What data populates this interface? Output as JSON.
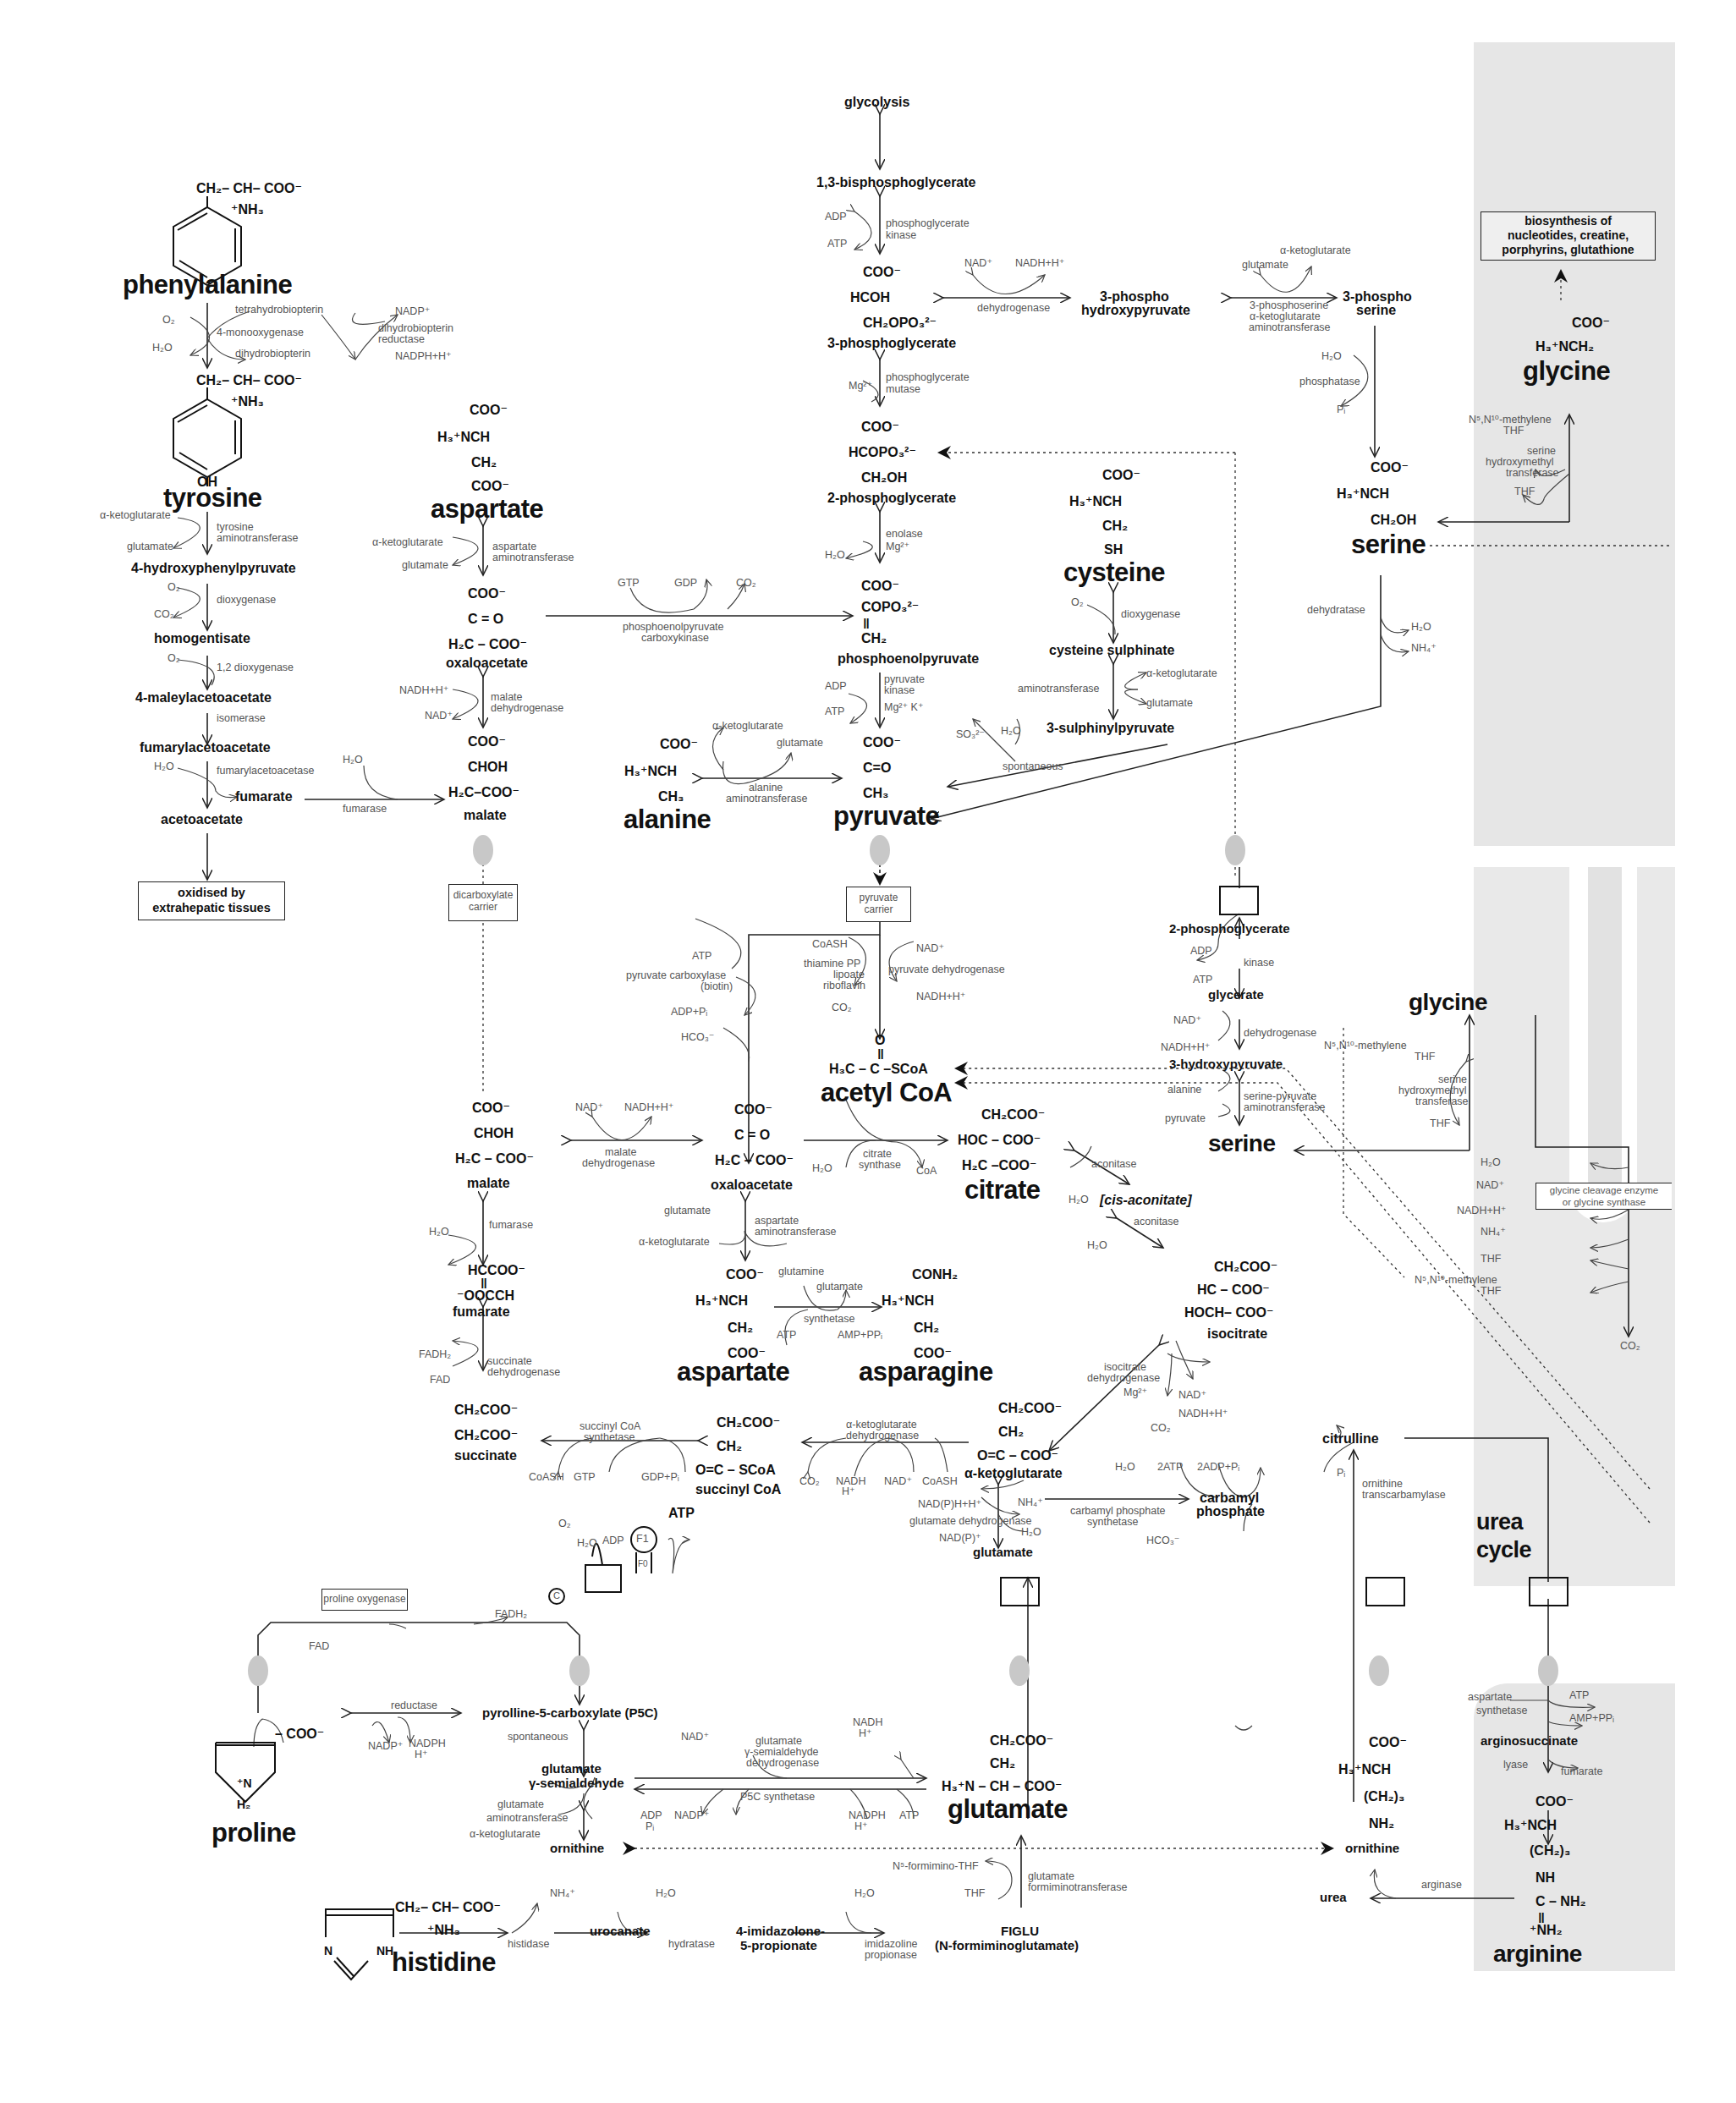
{
  "colors": {
    "mitochondria_shade": "#e6e6e6",
    "ink": "#111111",
    "enzyme_text": "#555555",
    "membrane_blob": "#c8c8c8"
  },
  "metabolites": {
    "glycolysis": "glycolysis",
    "bpg13": "1,3-bisphosphoglycerate",
    "pg3": "3-phosphoglycerate",
    "pg2": "2-phosphoglycerate",
    "pep": "phosphoenolpyruvate",
    "pyruvate": "pyruvate",
    "alanine": "alanine",
    "phospho_hydroxypyruvate": [
      "3-phospho",
      "hydroxypyruvate"
    ],
    "phospho_serine": [
      "3-phospho",
      "serine"
    ],
    "serine_top": "serine",
    "glycine_top": "glycine",
    "cysteine": "cysteine",
    "cysteine_sulphinate": "cysteine sulphinate",
    "sulphinylpyruvate": "3-sulphinylpyruvate",
    "phenylalanine": "phenylalanine",
    "tyrosine": "tyrosine",
    "hydroxyphenylpyruvate": "4-hydroxyphenylpyruvate",
    "homogentisate": "homogentisate",
    "maleylacetoacetate": "4-maleylacetoacetate",
    "fumarylacetoacetate": "fumarylacetoacetate",
    "fumarate_cyto": "fumarate",
    "acetoacetate": "acetoacetate",
    "aspartate_top": "aspartate",
    "oxaloacetate_cyto": "oxaloacetate",
    "malate_cyto": "malate",
    "acetyl_coa": "acetyl CoA",
    "citrate": "citrate",
    "cis_aconitate": "[cis-aconitate]",
    "isocitrate": "isocitrate",
    "alpha_kg": "α-ketoglutarate",
    "succinyl_coa": "succinyl CoA",
    "succinate": "succinate",
    "fumarate_mito": "fumarate",
    "malate_mito": "malate",
    "oxaloacetate_mito": "oxaloacetate",
    "aspartate_mito": "aspartate",
    "asparagine": "asparagine",
    "glutamate_mito": "glutamate",
    "carbamyl_phosphate": [
      "carbamyl",
      "phosphate"
    ],
    "citrulline": "citrulline",
    "urea_cycle": [
      "urea",
      "cycle"
    ],
    "pg2_mito": "2-phosphoglycerate",
    "glycerate": "glycerate",
    "hydroxypyruvate3": "3-hydroxypyruvate",
    "serine_mito": "serine",
    "glycine_mito": "glycine",
    "p5c": "pyrolline-5-carboxylate (P5C)",
    "glu_semialdehyde": [
      "glutamate",
      "γ-semialdehyde"
    ],
    "proline": "proline",
    "ornithine_left": "ornithine",
    "glutamate_cyto": "glutamate",
    "histidine": "histidine",
    "urocanate": "urocanate",
    "imidazolone": [
      "4-imidazolone-",
      "5-propionate"
    ],
    "figlu": [
      "FIGLU",
      "(N-formiminoglutamate)"
    ],
    "ornithine_right": "ornithine",
    "urea": "urea",
    "arginosuccinate": "arginosuccinate",
    "arginine": "arginine",
    "atp_bold": "ATP"
  },
  "formulas": {
    "phe": [
      "CH₂– CH– COO⁻",
      "⁺NH₃"
    ],
    "tyr": [
      "CH₂– CH– COO⁻",
      "⁺NH₃",
      "OH"
    ],
    "asp_top": [
      "COO⁻",
      "H₃⁺NCH",
      "CH₂",
      "COO⁻"
    ],
    "oaa_cyto": [
      "COO⁻",
      "C = O",
      "H₂C – COO⁻"
    ],
    "mal_cyto": [
      "COO⁻",
      "CHOH",
      "H₂C–COO⁻"
    ],
    "pg3": [
      "COO⁻",
      "HCOH",
      "CH₂OPO₃²⁻"
    ],
    "pg2": [
      "COO⁻",
      "HCOPO₃²⁻",
      "CH₂OH"
    ],
    "pep": [
      "COO⁻",
      "COPO₃²⁻",
      "‖",
      "CH₂"
    ],
    "pyr": [
      "COO⁻",
      "C=O",
      "CH₃"
    ],
    "ala": [
      "COO⁻",
      "H₃⁺NCH",
      "CH₃"
    ],
    "cys": [
      "COO⁻",
      "H₃⁺NCH",
      "CH₂",
      "SH"
    ],
    "ser_top": [
      "COO⁻",
      "H₃⁺NCH",
      "CH₂OH"
    ],
    "gly_top": [
      "COO⁻",
      "H₃⁺NCH₂"
    ],
    "acoa": [
      "O",
      "‖",
      "H₃C – C –SCoA"
    ],
    "citrate": [
      "CH₂COO⁻",
      "HOC – COO⁻",
      "H₂C –COO⁻"
    ],
    "oaa_mito": [
      "COO⁻",
      "C = O",
      "H₂C – COO⁻"
    ],
    "mal_mito": [
      "COO⁻",
      "CHOH",
      "H₂C – COO⁻"
    ],
    "fum_mito": [
      "HCCOO⁻",
      "‖",
      "⁻OOCCH"
    ],
    "succ": [
      "CH₂COO⁻",
      "CH₂COO⁻"
    ],
    "scoa": [
      "CH₂COO⁻",
      "CH₂",
      "O=C – SCoA"
    ],
    "akg": [
      "CH₂COO⁻",
      "CH₂",
      "O=C – COO⁻"
    ],
    "isocit": [
      "CH₂COO⁻",
      "HC – COO⁻",
      "HOCH– COO⁻"
    ],
    "asp_mito": [
      "COO⁻",
      "H₃⁺NCH",
      "CH₂",
      "COO⁻"
    ],
    "asn": [
      "CONH₂",
      "H₃⁺NCH",
      "CH₂",
      "COO⁻"
    ],
    "glu_cyto": [
      "CH₂COO⁻",
      "CH₂",
      "H₃⁺N – CH – COO⁻"
    ],
    "orn": [
      "COO⁻",
      "H₃⁺NCH",
      "(CH₂)₃",
      "NH₂"
    ],
    "arg": [
      "COO⁻",
      "H₃⁺NCH",
      "(CH₂)₃",
      "NH",
      "C – NH₂",
      "‖",
      "⁺NH₂"
    ],
    "pro": [
      "– COO⁻",
      "⁺N",
      "H₂"
    ],
    "his": [
      "CH₂– CH– COO⁻",
      "⁺NH₃",
      "N",
      "NH"
    ]
  },
  "enzymes": {
    "pgk": [
      "phosphoglycerate",
      "kinase"
    ],
    "pgm": [
      "phosphoglycerate",
      "mutase"
    ],
    "enolase": [
      "enolase",
      "Mg²⁺"
    ],
    "pk": [
      "pyruvate",
      "kinase"
    ],
    "pk_cof": "Mg²⁺ K⁺",
    "pgdh": "dehydrogenase",
    "psat": [
      "3-phosphoserine",
      "α-ketoglutarate",
      "aminotransferase"
    ],
    "psp": "phosphatase",
    "shmt_top": [
      "serine",
      "hydroxymethyl",
      "transferase"
    ],
    "dehydratase": "dehydratase",
    "cdo": "dioxygenase",
    "cys_at": "aminotransferase",
    "spontaneous": "spontaneous",
    "alt": [
      "alanine",
      "aminotransferase"
    ],
    "pepck": [
      "phosphoenolpyruvate",
      "carboxykinase"
    ],
    "pah": "4-monooxygenase",
    "dhpr": [
      "dihydrobiopterin",
      "reductase"
    ],
    "tat": [
      "tyrosine",
      "aminotransferase"
    ],
    "hppd": "dioxygenase",
    "hgd": "1,2 dioxygenase",
    "isomerase": "isomerase",
    "fah": "fumarylacetoacetase",
    "fumarase_cyto": "fumarase",
    "ast_top": [
      "aspartate",
      "aminotransferase"
    ],
    "mdh_cyto": [
      "malate",
      "dehydrogenase"
    ],
    "pc": [
      "pyruvate carboxylase",
      "(biotin)"
    ],
    "pdh": "pyruvate dehydrogenase",
    "pdh_cof": [
      "thiamine PP",
      "lipoate",
      "riboflavin"
    ],
    "mdh_mito": [
      "malate",
      "dehydrogenase"
    ],
    "cs": [
      "citrate",
      "synthase"
    ],
    "aconitase1": "aconitase",
    "aconitase2": "aconitase",
    "fumarase_mito": "fumarase",
    "sdh": [
      "succinate",
      "dehydrogenase"
    ],
    "ast_mito": [
      "aspartate",
      "aminotransferase"
    ],
    "asns": "synthetase",
    "idh": [
      "isocitrate",
      "dehydrogenase"
    ],
    "akgdh": [
      "α-ketoglutarate",
      "dehydrogenase"
    ],
    "scs": [
      "succinyl CoA",
      "synthetase"
    ],
    "gdh": "glutamate dehydrogenase",
    "cps": [
      "carbamyl phosphate",
      "synthetase"
    ],
    "otc": [
      "ornithine",
      "transcarbamylase"
    ],
    "kinase": "kinase",
    "gdh2": "dehydrogenase",
    "spat": [
      "serine-pyruvate",
      "aminotransferase"
    ],
    "shmt_mito": [
      "serine",
      "hydroxymethyl",
      "transferase"
    ],
    "gcs": [
      "glycine cleavage enzyme",
      "or glycine synthase"
    ],
    "p5c_reductase": "reductase",
    "p5c_spont": "spontaneous",
    "g5sdh": [
      "glutamate",
      "γ-semialdehyde",
      "dehydrogenase"
    ],
    "p5cs": "P5C synthetase",
    "oat": [
      "glutamate",
      "aminotransferase"
    ],
    "histidase": "histidase",
    "hydratase": "hydratase",
    "imid_prop": [
      "imidazoline",
      "propionase"
    ],
    "ftcd": [
      "glutamate",
      "formiminotransferase"
    ],
    "ass": [
      "aspartate",
      "synthetase"
    ],
    "lyase": "lyase",
    "arginase": "arginase"
  },
  "cofactors": {
    "adp": "ADP",
    "atp": "ATP",
    "nad": "NAD⁺",
    "nadh": "NADH+H⁺",
    "glutamate": "glutamate",
    "akg": "α-ketoglutarate",
    "mg": "Mg²⁺",
    "h2o": "H₂O",
    "pi": "Pᵢ",
    "o2": "O₂",
    "co2": "CO₂",
    "nh4": "NH₄⁺",
    "gtp": "GTP",
    "gdp": "GDP",
    "so3": "SO₃²⁻",
    "thf": "THF",
    "methylene_thf": [
      "N⁵,N¹⁰-methylene",
      "THF"
    ],
    "bh4": "tetrahydrobiopterin",
    "bh2": "dihydrobiopterin",
    "nadp": "NADP⁺",
    "nadph": "NADPH+H⁺",
    "coash": "CoASH",
    "coa": "CoA",
    "adp_pi": "ADP+Pᵢ",
    "hco3": "HCO₃⁻",
    "gdp_pi": "GDP+Pᵢ",
    "fadh2": "FADH₂",
    "fad": "FAD",
    "glutamine": "glutamine",
    "amp_ppi": "AMP+PPᵢ",
    "nadph_h": [
      "NADPH",
      "H⁺"
    ],
    "nadh_h": [
      "NADH",
      "H⁺"
    ],
    "adp_pi2": [
      "ADP",
      "Pᵢ"
    ],
    "nadp_h_plus": "NAD(P)H+H⁺",
    "nadp_plus": "NAD(P)⁺",
    "two_atp": "2ATP",
    "two_adp_pi": "2ADP+Pᵢ",
    "n5_formimino": "N⁵-formimino-THF",
    "alanine": "alanine",
    "pyruvate": "pyruvate",
    "fumarate": "fumarate"
  },
  "boxes": {
    "biosynthesis": [
      "biosynthesis of",
      "nucleotides, creatine,",
      "porphyrins, glutathione"
    ],
    "oxidised": [
      "oxidised by",
      "extrahepatic tissues"
    ],
    "dicarboxylate": [
      "dicarboxylate",
      "carrier"
    ],
    "pyruvate_carrier": [
      "pyruvate",
      "carrier"
    ],
    "proline_oxygenase": "proline oxygenase",
    "complex_c": "C",
    "f1": "F1",
    "f0": "F0"
  }
}
